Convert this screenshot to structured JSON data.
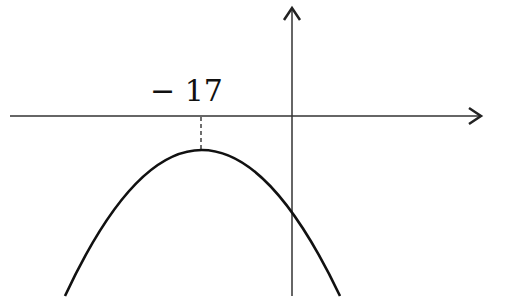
{
  "diagram": {
    "type": "parabola-graph",
    "labels": {
      "vertex_x": "− 17"
    },
    "colors": {
      "axis": "#333333",
      "curve": "#111111",
      "background": "#ffffff"
    },
    "axes": {
      "x_axis": {
        "y_px": 116,
        "from_x": 10,
        "to_x": 482,
        "arrow": "right"
      },
      "y_axis": {
        "x_px": 292,
        "from_y": 296,
        "to_y": 8,
        "arrow": "up"
      }
    },
    "parabola": {
      "opens": "down",
      "vertex_px": [
        201,
        150
      ],
      "y_intercept_px": [
        292,
        189
      ],
      "vertex_x_value": -17,
      "vertex_below_x_axis": true
    },
    "guide": {
      "style": "dashed",
      "from_px": [
        201,
        116
      ],
      "to_px": [
        201,
        150
      ]
    }
  }
}
